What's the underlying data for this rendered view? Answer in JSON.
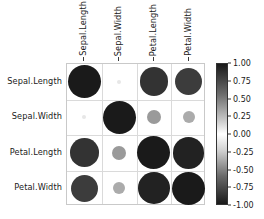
{
  "chart_data": {
    "type": "heatmap",
    "title": "",
    "xlabel": "",
    "ylabel": "",
    "variables": [
      "Sepal.Length",
      "Sepal.Width",
      "Petal.Length",
      "Petal.Width"
    ],
    "categories": [
      "Sepal.Length",
      "Sepal.Width",
      "Petal.Length",
      "Petal.Width"
    ],
    "row_labels": [
      "Sepal.Length",
      "Sepal.Width",
      "Petal.Length",
      "Petal.Width"
    ],
    "col_labels": [
      "Sepal.Length",
      "Sepal.Width",
      "Petal.Length",
      "Petal.Width"
    ],
    "matrix": [
      [
        1.0,
        -0.12,
        0.87,
        0.82
      ],
      [
        -0.12,
        1.0,
        -0.43,
        -0.37
      ],
      [
        0.87,
        -0.43,
        1.0,
        0.96
      ],
      [
        0.82,
        -0.37,
        0.96,
        1.0
      ]
    ],
    "series": [
      {
        "name": "Sepal.Length",
        "values": [
          1.0,
          -0.12,
          0.87,
          0.82
        ]
      },
      {
        "name": "Sepal.Width",
        "values": [
          -0.12,
          1.0,
          -0.43,
          -0.37
        ]
      },
      {
        "name": "Petal.Length",
        "values": [
          0.87,
          -0.43,
          1.0,
          0.96
        ]
      },
      {
        "name": "Petal.Width",
        "values": [
          0.82,
          -0.37,
          0.96,
          1.0
        ]
      }
    ],
    "encoding": {
      "marker": "circle",
      "size_by": "absolute_value",
      "color_by": "value",
      "colormap": "grayscale_diverging"
    },
    "grid": true,
    "legend_position": "right",
    "colorbar": {
      "min": -1.0,
      "max": 1.0,
      "ticks": [
        1.0,
        0.75,
        0.5,
        0.25,
        0.0,
        -0.25,
        -0.5,
        -0.75,
        -1.0
      ],
      "tick_labels": [
        "1.00",
        "0.75",
        "0.50",
        "0.25",
        "0.00",
        "-0.25",
        "-0.50",
        "-0.75",
        "-1.00"
      ],
      "orientation": "vertical",
      "stops": [
        {
          "pos": 0.0,
          "hex": "#1a1a1a"
        },
        {
          "pos": 0.22,
          "hex": "#6e6e6e"
        },
        {
          "pos": 0.4,
          "hex": "#c8c8c8"
        },
        {
          "pos": 0.5,
          "hex": "#ffffff"
        },
        {
          "pos": 0.62,
          "hex": "#cfcfcf"
        },
        {
          "pos": 0.8,
          "hex": "#6a6a6a"
        },
        {
          "pos": 1.0,
          "hex": "#1a1a1a"
        }
      ]
    },
    "colors": {
      "background": "#ffffff",
      "gridline": "#dadada",
      "axis_border": "#c9c9c9",
      "text": "#1a1a1a",
      "tick_mark": "#333333"
    }
  }
}
